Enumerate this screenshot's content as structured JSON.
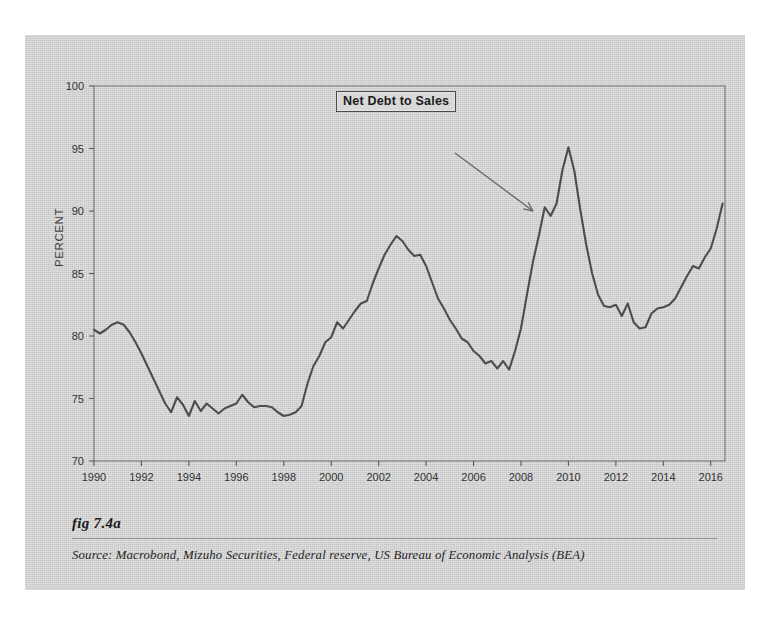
{
  "figure": {
    "fig_label": "fig 7.4a",
    "source": "Source:  Macrobond, Mizuho Securities, Federal reserve, US Bureau of Economic Analysis (BEA)",
    "background_color": "#d5d5d5",
    "line_color": "#4d4d4d"
  },
  "annotation": {
    "label": "Net Debt to Sales",
    "arrow_from": [
      430,
      118
    ],
    "arrow_to": [
      508,
      176
    ]
  },
  "chart_data": {
    "type": "line",
    "title": "",
    "xlabel": "",
    "ylabel": "PERCENT",
    "xlim": [
      1990,
      2016.6
    ],
    "ylim": [
      70,
      100
    ],
    "yticks": [
      70,
      75,
      80,
      85,
      90,
      95,
      100
    ],
    "xticks": [
      1990,
      1992,
      1994,
      1996,
      1998,
      2000,
      2002,
      2004,
      2006,
      2008,
      2010,
      2012,
      2014,
      2016
    ],
    "grid": false,
    "legend": false,
    "series": [
      {
        "name": "Net Debt to Sales",
        "units": "percent",
        "x": [
          1990.0,
          1990.25,
          1990.5,
          1990.75,
          1991.0,
          1991.25,
          1991.5,
          1991.75,
          1992.0,
          1992.25,
          1992.5,
          1992.75,
          1993.0,
          1993.25,
          1993.5,
          1993.75,
          1994.0,
          1994.25,
          1994.5,
          1994.75,
          1995.0,
          1995.25,
          1995.5,
          1995.75,
          1996.0,
          1996.25,
          1996.5,
          1996.75,
          1997.0,
          1997.25,
          1997.5,
          1997.75,
          1998.0,
          1998.25,
          1998.5,
          1998.75,
          1999.0,
          1999.25,
          1999.5,
          1999.75,
          2000.0,
          2000.25,
          2000.5,
          2000.75,
          2001.0,
          2001.25,
          2001.5,
          2001.75,
          2002.0,
          2002.25,
          2002.5,
          2002.75,
          2003.0,
          2003.25,
          2003.5,
          2003.75,
          2004.0,
          2004.25,
          2004.5,
          2004.75,
          2005.0,
          2005.25,
          2005.5,
          2005.75,
          2006.0,
          2006.25,
          2006.5,
          2006.75,
          2007.0,
          2007.25,
          2007.5,
          2007.75,
          2008.0,
          2008.25,
          2008.5,
          2008.75,
          2009.0,
          2009.25,
          2009.5,
          2009.75,
          2010.0,
          2010.25,
          2010.5,
          2010.75,
          2011.0,
          2011.25,
          2011.5,
          2011.75,
          2012.0,
          2012.25,
          2012.5,
          2012.75,
          2013.0,
          2013.25,
          2013.5,
          2013.75,
          2014.0,
          2014.25,
          2014.5,
          2014.75,
          2015.0,
          2015.25,
          2015.5,
          2015.75,
          2016.0,
          2016.25,
          2016.5
        ],
        "y": [
          80.5,
          80.2,
          80.5,
          80.9,
          81.1,
          80.9,
          80.3,
          79.5,
          78.6,
          77.6,
          76.6,
          75.6,
          74.6,
          73.9,
          75.1,
          74.5,
          73.6,
          74.8,
          74.0,
          74.6,
          74.2,
          73.8,
          74.2,
          74.4,
          74.6,
          75.3,
          74.7,
          74.3,
          74.4,
          74.4,
          74.3,
          73.9,
          73.6,
          73.7,
          73.9,
          74.4,
          76.2,
          77.6,
          78.4,
          79.5,
          79.9,
          81.1,
          80.6,
          81.3,
          82.0,
          82.6,
          82.8,
          84.2,
          85.4,
          86.5,
          87.3,
          88.0,
          87.6,
          86.9,
          86.4,
          86.5,
          85.6,
          84.3,
          83.0,
          82.2,
          81.3,
          80.6,
          79.8,
          79.5,
          78.8,
          78.4,
          77.8,
          78.0,
          77.4,
          78.0,
          77.3,
          78.8,
          80.6,
          83.3,
          85.9,
          88.0,
          90.3,
          89.6,
          90.6,
          93.3,
          95.1,
          93.2,
          90.1,
          87.3,
          85.0,
          83.3,
          82.4,
          82.3,
          82.5,
          81.6,
          82.6,
          81.1,
          80.6,
          80.7,
          81.8,
          82.2,
          82.3,
          82.5,
          83.0,
          83.9,
          84.8,
          85.6,
          85.4,
          86.3,
          87.0,
          88.6,
          90.6
        ]
      }
    ]
  }
}
